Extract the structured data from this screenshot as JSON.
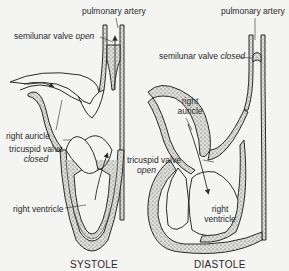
{
  "figure": {
    "panels": [
      {
        "id": "systole",
        "title": "SYSTOLE",
        "labels": {
          "pulmonary_artery": "pulmonary artery",
          "semilunar_valve": "semilunar valve",
          "semilunar_state": "open",
          "right_auricle": "right auricle",
          "tricuspid_valve": "tricuspid valve",
          "tricuspid_state": "closed",
          "right_ventricle": "right ventricle"
        }
      },
      {
        "id": "diastole",
        "title": "DIASTOLE",
        "labels": {
          "pulmonary_artery": "pulmonary artery",
          "semilunar_valve": "semilunar valve",
          "semilunar_state": "closed",
          "right_auricle_1": "right",
          "right_auricle_2": "auricle",
          "tricuspid_valve": "tricuspid valve",
          "tricuspid_state": "open",
          "right_ventricle_1": "right",
          "right_ventricle_2": "ventricle"
        }
      }
    ],
    "colors": {
      "line": "#2b2b2b",
      "muscle_fill": "#c9c9c4",
      "background": "#f4f4f2"
    }
  }
}
